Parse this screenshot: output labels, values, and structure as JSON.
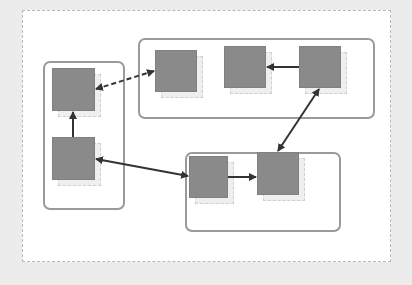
{
  "diagram": {
    "colors": {
      "background": "#ececec",
      "frame": "#ffffff",
      "group_border": "#9a9a9a",
      "node_fill": "#8a8a8a",
      "edge": "#333333"
    },
    "groups": [
      {
        "id": "left",
        "x": 43,
        "y": 61,
        "w": 82,
        "h": 149
      },
      {
        "id": "top-right",
        "x": 138,
        "y": 38,
        "w": 237,
        "h": 81
      },
      {
        "id": "bottom",
        "x": 185,
        "y": 152,
        "w": 156,
        "h": 80
      }
    ],
    "nodes": [
      {
        "id": "A",
        "group": "left",
        "x": 52,
        "y": 68,
        "w": 43,
        "h": 43
      },
      {
        "id": "B",
        "group": "left",
        "x": 52,
        "y": 137,
        "w": 43,
        "h": 43
      },
      {
        "id": "C",
        "group": "top-right",
        "x": 155,
        "y": 50,
        "w": 42,
        "h": 42
      },
      {
        "id": "D",
        "group": "top-right",
        "x": 224,
        "y": 46,
        "w": 42,
        "h": 42
      },
      {
        "id": "E",
        "group": "top-right",
        "x": 299,
        "y": 46,
        "w": 42,
        "h": 42
      },
      {
        "id": "F",
        "group": "bottom",
        "x": 189,
        "y": 156,
        "w": 39,
        "h": 42
      },
      {
        "id": "G",
        "group": "bottom",
        "x": 257,
        "y": 152,
        "w": 42,
        "h": 43
      }
    ],
    "edges": [
      {
        "from": "B",
        "to": "A",
        "style": "solid",
        "arrows": "end"
      },
      {
        "from": "A",
        "to": "C",
        "style": "dashed",
        "arrows": "both"
      },
      {
        "from": "E",
        "to": "D",
        "style": "solid",
        "arrows": "end"
      },
      {
        "from": "G",
        "to": "E",
        "style": "solid",
        "arrows": "both"
      },
      {
        "from": "B",
        "to": "F",
        "style": "solid",
        "arrows": "both"
      },
      {
        "from": "F",
        "to": "G",
        "style": "solid",
        "arrows": "end"
      }
    ]
  }
}
